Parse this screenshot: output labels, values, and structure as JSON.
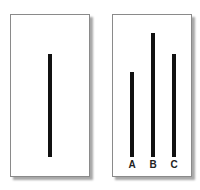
{
  "reference_card": {
    "line": {
      "relative_length": 103
    }
  },
  "comparison_card": {
    "lines": [
      {
        "label": "A",
        "relative_length": 85
      },
      {
        "label": "B",
        "relative_length": 124
      },
      {
        "label": "C",
        "relative_length": 103
      }
    ]
  }
}
